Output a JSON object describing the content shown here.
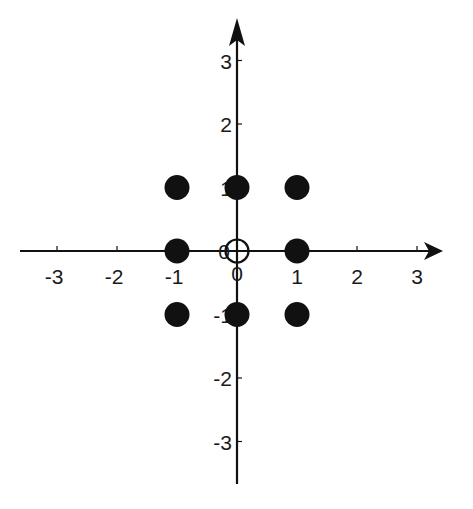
{
  "diagram": {
    "type": "constellation-plot",
    "x_axis": {
      "ticks": [
        -3,
        -2,
        -1,
        0,
        1,
        2,
        3
      ],
      "tick_labels": [
        "-3",
        "-2",
        "-1",
        "1",
        "2",
        "3"
      ],
      "zero_label": "0",
      "arrow": true
    },
    "y_axis": {
      "ticks": [
        -3,
        -2,
        -1,
        0,
        1,
        2,
        3
      ],
      "tick_labels": [
        "3",
        "2",
        "1",
        "-1",
        "-2",
        "-3"
      ],
      "zero_label": "0",
      "arrow": true
    },
    "points": [
      {
        "x": -1,
        "y": 1,
        "style": "filled"
      },
      {
        "x": 0,
        "y": 1,
        "style": "filled"
      },
      {
        "x": 1,
        "y": 1,
        "style": "filled"
      },
      {
        "x": -1,
        "y": 0,
        "style": "filled"
      },
      {
        "x": 0,
        "y": 0,
        "style": "hollow"
      },
      {
        "x": 1,
        "y": 0,
        "style": "filled"
      },
      {
        "x": -1,
        "y": -1,
        "style": "filled"
      },
      {
        "x": 0,
        "y": -1,
        "style": "filled"
      },
      {
        "x": 1,
        "y": -1,
        "style": "filled"
      }
    ],
    "colors": {
      "axis": "#111111",
      "point_fill": "#111111",
      "background": "#ffffff"
    }
  }
}
